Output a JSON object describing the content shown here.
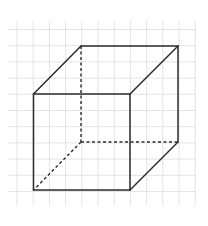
{
  "diagram": {
    "type": "cube-wireframe",
    "colors": {
      "background": "#ffffff",
      "grid": "#e4e4e4",
      "edge": "#2b2b2b"
    },
    "grid": {
      "x_start": 8,
      "x_end": 196,
      "y_start": 21,
      "y_end": 206,
      "spacing": 16.2,
      "x0": 17,
      "y0": 29.5
    },
    "vertices": {
      "front_top_left": [
        33.5,
        94
      ],
      "front_top_right": [
        130,
        94
      ],
      "front_bottom_left": [
        33.5,
        190
      ],
      "front_bottom_right": [
        130,
        190
      ],
      "back_top_left": [
        81,
        46
      ],
      "back_top_right": [
        178,
        46
      ],
      "back_bottom_left": [
        81,
        142
      ],
      "back_bottom_right": [
        178,
        142
      ]
    },
    "visible_edges": [
      [
        "front_top_left",
        "front_top_right"
      ],
      [
        "front_top_right",
        "front_bottom_right"
      ],
      [
        "front_bottom_right",
        "front_bottom_left"
      ],
      [
        "front_bottom_left",
        "front_top_left"
      ],
      [
        "front_top_left",
        "back_top_left"
      ],
      [
        "back_top_left",
        "back_top_right"
      ],
      [
        "back_top_right",
        "front_top_right"
      ],
      [
        "back_top_right",
        "back_bottom_right"
      ],
      [
        "back_bottom_right",
        "front_bottom_right"
      ]
    ],
    "hidden_edges": [
      [
        "back_top_left",
        "back_bottom_left"
      ],
      [
        "back_bottom_left",
        "back_bottom_right"
      ],
      [
        "back_bottom_left",
        "front_bottom_left"
      ]
    ]
  }
}
